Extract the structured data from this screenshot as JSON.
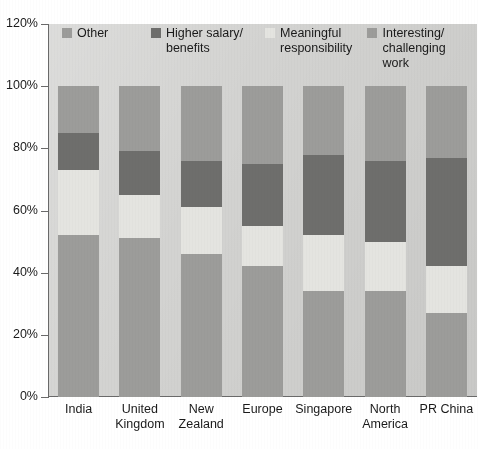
{
  "chart_data": {
    "type": "bar",
    "subtype": "stacked-bar-100",
    "title": "",
    "xlabel": "",
    "ylabel": "",
    "ylim": [
      0,
      120
    ],
    "ytick_labels": [
      "0%",
      "20%",
      "40%",
      "60%",
      "80%",
      "100%",
      "120%"
    ],
    "ytick_values": [
      0,
      20,
      40,
      60,
      80,
      100,
      120
    ],
    "grid": false,
    "legend_position": "top-inside",
    "categories": [
      "India",
      "United\nKingdom",
      "New\nZealand",
      "Europe",
      "Singapore",
      "North\nAmerica",
      "PR China"
    ],
    "series": [
      {
        "name": "Interesting/\nchallenging work",
        "color": "#9c9c9a",
        "values": [
          52,
          51,
          46,
          42,
          34,
          34,
          27
        ]
      },
      {
        "name": "Meaningful\nresponsibility",
        "color": "#e4e4e0",
        "values": [
          21,
          14,
          15,
          13,
          18,
          16,
          15
        ]
      },
      {
        "name": "Higher salary/\nbenefits",
        "color": "#6e6e6c",
        "values": [
          12,
          14,
          15,
          20,
          26,
          26,
          35
        ]
      },
      {
        "name": "Other",
        "color": "#9c9c9a",
        "values": [
          15,
          21,
          24,
          25,
          22,
          24,
          23
        ]
      }
    ]
  },
  "legend": {
    "items": [
      {
        "label": "Other",
        "color": "#9c9c9a"
      },
      {
        "label": "Higher salary/\nbenefits",
        "color": "#6e6e6c"
      },
      {
        "label": "Meaningful\nresponsibility",
        "color": "#e4e4e0"
      },
      {
        "label": "Interesting/\nchallenging work",
        "color": "#9c9c9a"
      }
    ]
  },
  "colors": {
    "plot_background": "#d3d3d1",
    "axis": "#6a6a6a",
    "text": "#1a1a1a",
    "page_background": "#ffffff"
  }
}
